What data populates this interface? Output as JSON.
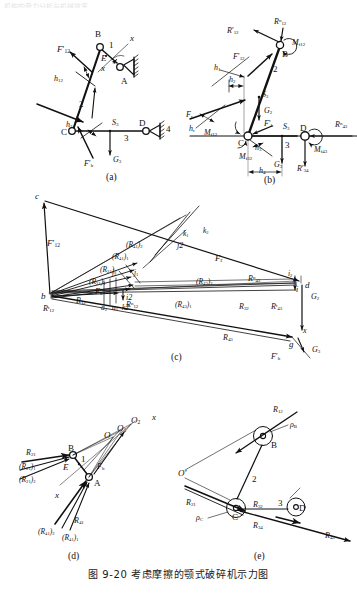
{
  "figure": {
    "caption": "图 9-20   考虑摩擦的颚式破碎机示力图",
    "top_cut_text": "机构的受力分析与机械效率",
    "panel_labels": [
      "(a)",
      "(b)",
      "(c)",
      "(d)",
      "(e)"
    ]
  },
  "panel_a": {
    "name": "mechanism-with-friction-forces",
    "joints": [
      "B",
      "A",
      "C",
      "D",
      "E"
    ],
    "links": [
      "1",
      "2",
      "3",
      "4"
    ],
    "forces": [
      {
        "label": "F'12",
        "base": "F",
        "prime": true,
        "sub": "12",
        "sup": ""
      },
      {
        "label": "F'b",
        "base": "F",
        "prime": true,
        "sub": "b",
        "sup": ""
      },
      {
        "label": "G3",
        "base": "G",
        "prime": false,
        "sub": "3",
        "sup": ""
      }
    ],
    "dims": [
      {
        "base": "h",
        "sub": "12"
      },
      {
        "base": "h",
        "sub": "3"
      }
    ],
    "points": [
      {
        "base": "S",
        "sub": "3"
      }
    ],
    "axes": [
      "x",
      "x"
    ]
  },
  "panel_b": {
    "name": "free-body-diagram",
    "joints": [
      "B",
      "C",
      "D"
    ],
    "links": [
      "2",
      "3"
    ],
    "forces": [
      {
        "base": "R",
        "prime": true,
        "sub": "12",
        "sup": ""
      },
      {
        "base": "R",
        "prime": false,
        "sub": "12",
        "sup": "n"
      },
      {
        "base": "F",
        "prime": true,
        "sub": "12",
        "sup": ""
      },
      {
        "base": "F",
        "prime": false,
        "sub": "r",
        "sup": ""
      },
      {
        "base": "F",
        "prime": true,
        "sub": "b",
        "sup": ""
      },
      {
        "base": "G",
        "prime": false,
        "sub": "2",
        "sup": ""
      },
      {
        "base": "G",
        "prime": false,
        "sub": "3",
        "sup": ""
      },
      {
        "base": "R",
        "prime": false,
        "sub": "43",
        "sup": "n"
      },
      {
        "base": "R",
        "prime": true,
        "sub": "34",
        "sup": ""
      }
    ],
    "moments": [
      {
        "base": "M",
        "sub": "f12"
      },
      {
        "base": "M",
        "sub": "f12"
      },
      {
        "base": "M",
        "sub": "f32"
      },
      {
        "base": "M",
        "sub": "f43"
      }
    ],
    "dims": [
      {
        "base": "h",
        "sub": "1"
      },
      {
        "base": "h",
        "sub": "2"
      },
      {
        "base": "h",
        "sub": "3"
      },
      {
        "base": "h",
        "sub": "r"
      },
      {
        "base": "h",
        "sub": "4"
      }
    ],
    "points": [
      {
        "base": "S",
        "sub": "2"
      },
      {
        "base": "S",
        "sub": "3"
      }
    ]
  },
  "panel_c": {
    "name": "force-polygon",
    "pole_points": [
      "b",
      "c",
      "d",
      "g",
      "i",
      "i1",
      "i2",
      "j",
      "j1",
      "j2",
      "k",
      "k1",
      "k2",
      "a",
      "a1",
      "a2"
    ],
    "vectors": [
      {
        "base": "F",
        "prime": true,
        "sub": "12",
        "sup": ""
      },
      {
        "base": "F",
        "prime": false,
        "sub": "r",
        "sup": ""
      },
      {
        "base": "F",
        "prime": false,
        "sub": "b",
        "sup": ""
      },
      {
        "base": "F",
        "prime": true,
        "sub": "b",
        "sup": ""
      },
      {
        "base": "G",
        "prime": false,
        "sub": "2",
        "sup": ""
      },
      {
        "base": "G",
        "prime": false,
        "sub": "3",
        "sup": ""
      },
      {
        "base": "R",
        "prime": false,
        "sub": "12",
        "sup": ""
      },
      {
        "base": "R",
        "prime": false,
        "sub": "12",
        "sup": "t"
      },
      {
        "base": "R",
        "prime": false,
        "sub": "12",
        "sup": "n"
      },
      {
        "base": "R",
        "prime": false,
        "sub": "32",
        "sup": ""
      },
      {
        "base": "R",
        "prime": false,
        "sub": "43",
        "sup": ""
      },
      {
        "base": "R",
        "prime": false,
        "sub": "43",
        "sup": "t"
      },
      {
        "base": "R",
        "prime": false,
        "sub": "43",
        "sup": "n"
      }
    ],
    "bracket_labels": [
      {
        "base": "R",
        "sub": "41",
        "idx": "1"
      },
      {
        "base": "R",
        "sub": "41",
        "idx": "2"
      },
      {
        "base": "R",
        "sub": "21",
        "idx": "1"
      },
      {
        "base": "R",
        "sub": "21",
        "idx": "2"
      },
      {
        "base": "R",
        "sub": "43",
        "idx": "1"
      },
      {
        "base": "R",
        "sub": "43",
        "idx": "2"
      }
    ],
    "axes": [
      "x"
    ]
  },
  "panel_d": {
    "name": "link1-force-balance",
    "joints": [
      "A",
      "B",
      "E"
    ],
    "links": [
      "1"
    ],
    "centers": [
      "O",
      "O1",
      "O2"
    ],
    "forces": [
      {
        "base": "R",
        "prime": false,
        "sub": "21",
        "sup": ""
      },
      {
        "base": "R",
        "prime": false,
        "sub": "41",
        "sup": ""
      },
      {
        "base": "F",
        "prime": false,
        "sub": "b",
        "sup": ""
      }
    ],
    "bracket_labels": [
      {
        "base": "R",
        "sub": "21",
        "idx": "1"
      },
      {
        "base": "R",
        "sub": "21",
        "idx": "2"
      },
      {
        "base": "R",
        "sub": "41",
        "idx": "1"
      },
      {
        "base": "R",
        "sub": "41",
        "idx": "2"
      }
    ],
    "axes": [
      "x",
      "x"
    ]
  },
  "panel_e": {
    "name": "friction-circle-diagram",
    "joints": [
      "B",
      "C",
      "D"
    ],
    "links": [
      "2",
      "3"
    ],
    "pole": "O'",
    "forces": [
      {
        "base": "R",
        "prime": false,
        "sub": "12",
        "sup": ""
      },
      {
        "base": "R",
        "prime": false,
        "sub": "21",
        "sup": ""
      },
      {
        "base": "R",
        "prime": false,
        "sub": "32",
        "sup": ""
      },
      {
        "base": "R",
        "prime": false,
        "sub": "34",
        "sup": ""
      },
      {
        "base": "R",
        "prime": false,
        "sub": "43",
        "sup": ""
      }
    ],
    "friction_radii": [
      {
        "base": "ρ",
        "sub": "B"
      },
      {
        "base": "ρ",
        "sub": "C"
      }
    ]
  },
  "colors": {
    "ink": "#111111",
    "thin": "#444444",
    "caption": "#1a1a1a"
  }
}
